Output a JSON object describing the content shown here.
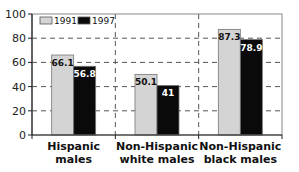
{
  "chart_data": {
    "type": "bar",
    "title": "",
    "xlabel": "",
    "ylabel": "",
    "ylim": [
      0,
      100
    ],
    "yticks": [
      0,
      20,
      40,
      60,
      80,
      100
    ],
    "grid": "dashed horizontal and category-separator verticals",
    "legend_position": "top-left",
    "categories": [
      [
        "Hispanic",
        "males"
      ],
      [
        "Non-Hispanic",
        "white males"
      ],
      [
        "Non-Hispanic",
        "black males"
      ]
    ],
    "series": [
      {
        "name": "1991",
        "color": "#d4d4d4",
        "label_color": "#111111",
        "values": [
          66.1,
          50.1,
          87.3
        ],
        "labels": [
          "66.1",
          "50.1",
          "87.3"
        ]
      },
      {
        "name": "1997",
        "color": "#0a0a0a",
        "label_color": "#ffffff",
        "values": [
          56.8,
          41,
          78.9
        ],
        "labels": [
          "56.8",
          "41",
          "78.9"
        ]
      }
    ]
  }
}
